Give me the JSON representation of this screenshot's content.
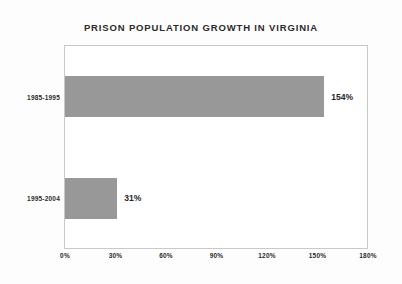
{
  "chart_data": {
    "type": "bar",
    "orientation": "horizontal",
    "title": "PRISON POPULATION GROWTH IN VIRGINIA",
    "xlabel": "",
    "ylabel": "",
    "categories": [
      "1985-1995",
      "1995-2004"
    ],
    "values": [
      154,
      31
    ],
    "value_labels": [
      "154%",
      "31%"
    ],
    "xlim": [
      0,
      180
    ],
    "xticks": [
      0,
      30,
      60,
      90,
      120,
      150,
      180
    ],
    "xtick_labels": [
      "0%",
      "30%",
      "60%",
      "90%",
      "120%",
      "150%",
      "180%"
    ],
    "grid": false,
    "legend": null,
    "series": [
      {
        "name": "Prison population growth",
        "values": [
          154,
          31
        ],
        "color": "#989898"
      }
    ]
  },
  "colors": {
    "background": "#fdfdfd",
    "plot_background": "#ffffff",
    "bar_fill": "#989898",
    "frame_border": "#c9c9c9",
    "text": "#2b2b2b"
  }
}
